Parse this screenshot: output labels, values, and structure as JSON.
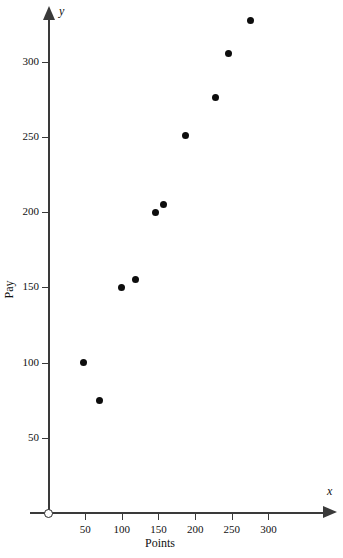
{
  "chart_data": {
    "type": "scatter",
    "title": "",
    "xlabel": "Points",
    "ylabel": "Pay",
    "x_var_symbol": "x",
    "y_var_symbol": "y",
    "xlim": [
      0,
      340
    ],
    "ylim": [
      0,
      340
    ],
    "xticks": [
      50,
      100,
      150,
      200,
      250,
      300
    ],
    "yticks": [
      50,
      100,
      150,
      200,
      250,
      300
    ],
    "xtick_labels": [
      "50",
      "100",
      "150",
      "200",
      "250",
      "300"
    ],
    "ytick_labels": [
      "50",
      "100",
      "150",
      "200",
      "250",
      "300"
    ],
    "grid": false,
    "legend": null,
    "origin_label": "O",
    "marker": "filled-circle",
    "marker_color": "#0d0d0d",
    "axis_color": "#3a3a3a",
    "points": [
      {
        "x": 48,
        "y": 100
      },
      {
        "x": 70,
        "y": 75
      },
      {
        "x": 99,
        "y": 150
      },
      {
        "x": 118,
        "y": 155
      },
      {
        "x": 146,
        "y": 200
      },
      {
        "x": 157,
        "y": 205
      },
      {
        "x": 187,
        "y": 251
      },
      {
        "x": 228,
        "y": 276
      },
      {
        "x": 246,
        "y": 305
      },
      {
        "x": 276,
        "y": 327
      }
    ]
  }
}
